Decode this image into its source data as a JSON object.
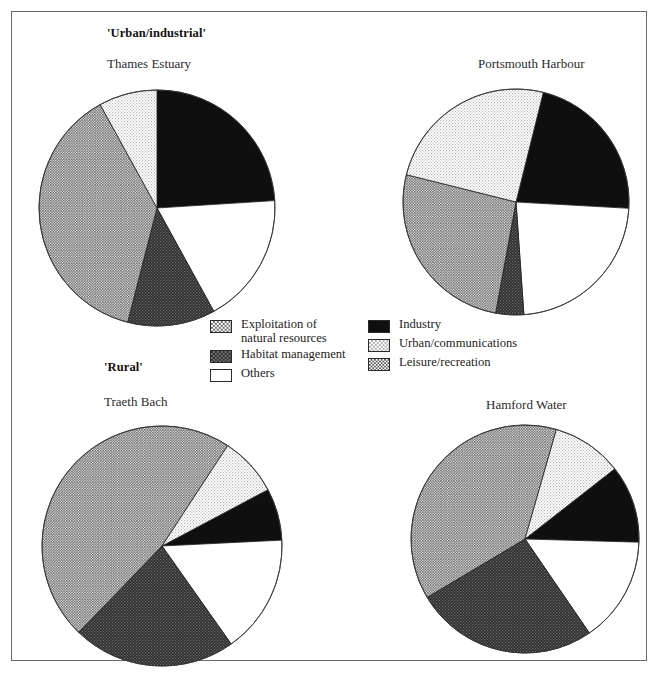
{
  "figure": {
    "group_labels": [
      {
        "id": "urban-industrial",
        "text": "'Urban/industrial'"
      },
      {
        "id": "rural",
        "text": "'Rural'"
      }
    ]
  },
  "legend": {
    "entries": [
      {
        "key": "exploitation",
        "label": "Exploitation of\nnatural resources",
        "color": "#9a9a9a",
        "pattern": "light-check"
      },
      {
        "key": "habitat",
        "label": "Habitat management",
        "color": "#4a4a4a",
        "pattern": "dark-check"
      },
      {
        "key": "others",
        "label": "Others",
        "color": "#ffffff",
        "pattern": "solid"
      },
      {
        "key": "industry",
        "label": "Industry",
        "color": "#0f0f0f",
        "pattern": "solid"
      },
      {
        "key": "urban",
        "label": "Urban/communications",
        "color": "#dcdcdc",
        "pattern": "dot"
      },
      {
        "key": "leisure",
        "label": "Leisure/recreation",
        "color": "#8e8e8e",
        "pattern": "med-check"
      }
    ],
    "left_column": [
      "exploitation",
      "habitat",
      "others"
    ],
    "right_column": [
      "industry",
      "urban",
      "leisure"
    ]
  },
  "chart_data": [
    {
      "type": "pie",
      "id": "thames-estuary",
      "title": "Thames Estuary",
      "group": "'Urban/industrial'",
      "start_angle": 0,
      "categories": [
        "Industry",
        "Others",
        "Habitat management",
        "Leisure/recreation",
        "Urban/communications"
      ],
      "values": [
        24,
        18,
        12,
        38,
        8
      ],
      "colors": [
        "#0f0f0f",
        "#ffffff",
        "#4a4a4a",
        "#8e8e8e",
        "#dcdcdc"
      ],
      "patterns": [
        "solid",
        "solid",
        "dark-check",
        "med-check",
        "dot"
      ]
    },
    {
      "type": "pie",
      "id": "portsmouth-harbour",
      "title": "Portsmouth Harbour",
      "group": "'Urban/industrial'",
      "start_angle": 14,
      "categories": [
        "Industry",
        "Others",
        "Habitat management",
        "Leisure/recreation",
        "Urban/communications"
      ],
      "values": [
        22,
        23,
        4,
        26,
        25
      ],
      "colors": [
        "#0f0f0f",
        "#ffffff",
        "#4a4a4a",
        "#8e8e8e",
        "#dcdcdc"
      ],
      "patterns": [
        "solid",
        "solid",
        "dark-check",
        "med-check",
        "dot"
      ]
    },
    {
      "type": "pie",
      "id": "traeth-bach",
      "title": "Traeth Bach",
      "group": "'Rural'",
      "start_angle": 62,
      "categories": [
        "Industry",
        "Others",
        "Habitat management",
        "Leisure/recreation",
        "Urban/communications"
      ],
      "values": [
        7,
        16,
        22,
        47,
        8
      ],
      "colors": [
        "#0f0f0f",
        "#ffffff",
        "#4a4a4a",
        "#8e8e8e",
        "#dcdcdc"
      ],
      "patterns": [
        "solid",
        "solid",
        "dark-check",
        "med-check",
        "dot"
      ]
    },
    {
      "type": "pie",
      "id": "hamford-water",
      "title": "Hamford Water",
      "group": "'Rural'",
      "start_angle": 52,
      "categories": [
        "Industry",
        "Others",
        "Habitat management",
        "Leisure/recreation",
        "Urban/communications"
      ],
      "values": [
        11,
        15,
        26,
        38,
        10
      ],
      "colors": [
        "#0f0f0f",
        "#ffffff",
        "#4a4a4a",
        "#8e8e8e",
        "#dcdcdc"
      ],
      "patterns": [
        "solid",
        "solid",
        "dark-check",
        "med-check",
        "dot"
      ]
    }
  ],
  "layout": {
    "pies": [
      {
        "id": "thames-estuary",
        "cx": 145,
        "cy": 196,
        "r": 118,
        "label_x": 95,
        "label_y": 25,
        "title_x": 95,
        "title_y": 44
      },
      {
        "id": "portsmouth-harbour",
        "cx": 504,
        "cy": 190,
        "r": 113,
        "label_x": 0,
        "label_y": 0,
        "title_x": 466,
        "title_y": 44
      },
      {
        "id": "traeth-bach",
        "cx": 150,
        "cy": 534,
        "r": 120,
        "label_x": 102,
        "label_y": 358,
        "title_x": 92,
        "title_y": 382
      },
      {
        "id": "hamford-water",
        "cx": 513,
        "cy": 527,
        "r": 114,
        "label_x": 0,
        "label_y": 0,
        "title_x": 474,
        "title_y": 385
      }
    ]
  }
}
